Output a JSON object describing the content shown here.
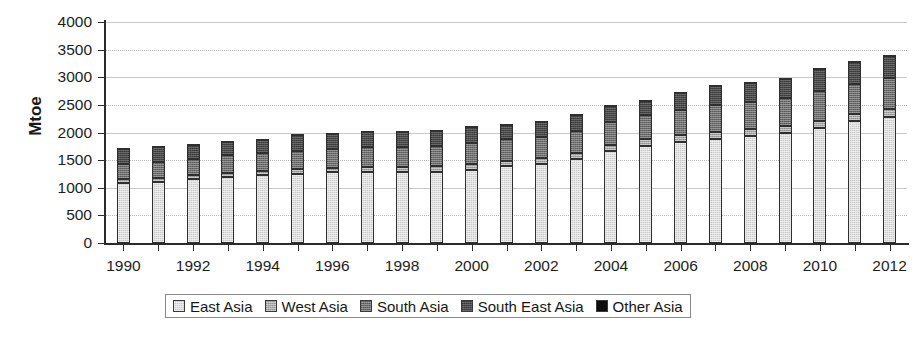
{
  "chart_data": {
    "type": "bar",
    "subtype": "stacked-bar",
    "title": "",
    "xlabel": "",
    "ylabel": "Mtoe",
    "ylim": [
      0,
      4000
    ],
    "ytick_labels": [
      "4000",
      "3500",
      "3000",
      "2500",
      "2000",
      "1500",
      "1000",
      "500",
      "0"
    ],
    "ytick_values": [
      4000,
      3500,
      3000,
      2500,
      2000,
      1500,
      1000,
      500,
      0
    ],
    "ytick_step": 500,
    "grid": true,
    "grid_axis": "y",
    "legend_position": "bottom",
    "categories": [
      1990,
      1991,
      1992,
      1993,
      1994,
      1995,
      1996,
      1997,
      1998,
      1999,
      2000,
      2001,
      2002,
      2003,
      2004,
      2005,
      2006,
      2007,
      2008,
      2009,
      2010,
      2011,
      2012
    ],
    "xtick_labels": [
      "1990",
      "1992",
      "1994",
      "1996",
      "1998",
      "2000",
      "2002",
      "2004",
      "2006",
      "2008",
      "2010",
      "2012"
    ],
    "xtick_values": [
      1990,
      1992,
      1994,
      1996,
      1998,
      2000,
      2002,
      2004,
      2006,
      2008,
      2010,
      2012
    ],
    "series": [
      {
        "name": "East Asia",
        "color": "#c9c9c9",
        "values": [
          1080,
          1100,
          1150,
          1200,
          1230,
          1250,
          1280,
          1290,
          1280,
          1290,
          1330,
          1390,
          1430,
          1520,
          1660,
          1760,
          1830,
          1890,
          1930,
          1990,
          2080,
          2200,
          2280
        ]
      },
      {
        "name": "West Asia",
        "color": "#a5a5a5",
        "values": [
          70,
          70,
          75,
          75,
          80,
          85,
          85,
          90,
          90,
          95,
          95,
          100,
          100,
          105,
          110,
          115,
          120,
          125,
          130,
          130,
          135,
          140,
          145
        ]
      },
      {
        "name": "South Asia",
        "color": "#6e6e6e",
        "values": [
          280,
          290,
          300,
          310,
          320,
          330,
          340,
          350,
          360,
          370,
          380,
          385,
          395,
          405,
          420,
          435,
          455,
          480,
          495,
          510,
          530,
          545,
          565
        ]
      },
      {
        "name": "South East Asia",
        "color": "#484848",
        "values": [
          280,
          290,
          260,
          255,
          250,
          295,
          275,
          280,
          280,
          285,
          310,
          260,
          280,
          295,
          305,
          275,
          315,
          350,
          340,
          355,
          405,
          390,
          390
        ]
      },
      {
        "name": "Other Asia",
        "color": "#0d0d0d",
        "values": [
          10,
          10,
          10,
          10,
          10,
          10,
          10,
          10,
          10,
          10,
          10,
          10,
          10,
          10,
          10,
          10,
          10,
          10,
          10,
          10,
          10,
          15,
          15
        ]
      }
    ],
    "totals": [
      1720,
      1760,
      1795,
      1850,
      1890,
      1970,
      1990,
      2010,
      2000,
      2030,
      2120,
      2135,
      2205,
      2325,
      2495,
      2585,
      2710,
      2845,
      2885,
      2965,
      3150,
      3280,
      3385
    ]
  },
  "legend": {
    "items": [
      {
        "label": "East Asia",
        "swatch": "series-swatch-east-asia"
      },
      {
        "label": "West Asia",
        "swatch": "series-swatch-west-asia"
      },
      {
        "label": "South Asia",
        "swatch": "series-swatch-south-asia"
      },
      {
        "label": "South East Asia",
        "swatch": "series-swatch-south-east-asia"
      },
      {
        "label": "Other Asia",
        "swatch": "series-swatch-other-asia"
      }
    ]
  }
}
